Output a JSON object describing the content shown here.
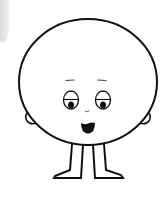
{
  "image": {
    "description": "Cartoon character with a large round head, small ears, sleepy half-closed eyes, open mouth, and two thin legs with outward-pointing feet",
    "background_color": "#ffffff",
    "stroke_color": "#111111",
    "fill_color": "#ffffff",
    "corner_shade_color": "#dddddd"
  },
  "character": {
    "head": {
      "cx": 88,
      "cy": 82,
      "rx": 69,
      "ry": 63
    },
    "eyebrows": [
      {
        "x1": 66,
        "y1": 80,
        "x2": 74,
        "y2": 80
      },
      {
        "x1": 98,
        "y1": 80,
        "x2": 106,
        "y2": 80
      }
    ],
    "eyes": [
      {
        "cx": 71,
        "cy": 100,
        "rx": 7.5,
        "ry": 9
      },
      {
        "cx": 103,
        "cy": 100,
        "rx": 7.5,
        "ry": 9
      }
    ],
    "ears": [
      {
        "side": "left",
        "cx": 31,
        "cy": 117
      },
      {
        "side": "right",
        "cx": 145,
        "cy": 117
      }
    ],
    "expression": "sleepy, open mouth"
  }
}
